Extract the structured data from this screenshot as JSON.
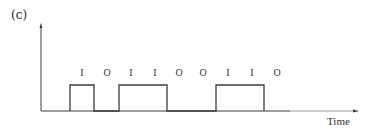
{
  "figure": {
    "panel_label": "(c)",
    "x_axis_label": "Time",
    "bits": [
      "I",
      "O",
      "I",
      "I",
      "O",
      "O",
      "I",
      "I",
      "O"
    ],
    "line_color": "#3a3a3a",
    "pulses": [
      {
        "start_bit": 0,
        "end_bit": 1
      },
      {
        "start_bit": 2,
        "end_bit": 4
      },
      {
        "start_bit": 6,
        "end_bit": 8
      }
    ]
  }
}
